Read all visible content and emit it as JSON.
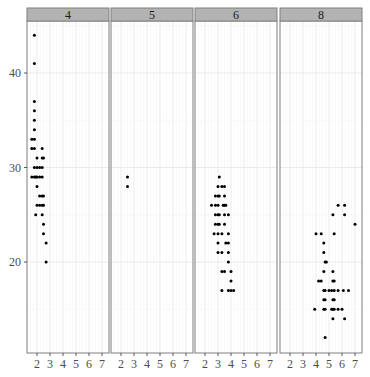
{
  "chart_data": {
    "type": "scatter",
    "title": "",
    "xlabel": "",
    "ylabel": "",
    "facet_by": "cyl",
    "facets": [
      "4",
      "5",
      "6",
      "8"
    ],
    "xlim": [
      1.2,
      7.2
    ],
    "ylim": [
      10.5,
      45.5
    ],
    "x_ticks": [
      2,
      3,
      4,
      5,
      6,
      7
    ],
    "y_ticks": [
      20,
      30,
      40
    ],
    "grid": true,
    "legend": "none",
    "colors": {
      "point": "#000000",
      "strip_bg": "#b3b3b3",
      "strip_border": "#7f7f7f",
      "panel_border": "#7f7f7f",
      "grid_major": "#e6e6e6",
      "grid_minor": "#f2f2f2"
    },
    "panels": [
      {
        "label": "4",
        "points": [
          [
            1.8,
            44
          ],
          [
            1.8,
            41
          ],
          [
            1.8,
            37
          ],
          [
            1.8,
            36
          ],
          [
            1.8,
            35
          ],
          [
            1.8,
            34
          ],
          [
            1.8,
            33
          ],
          [
            1.6,
            33
          ],
          [
            1.6,
            32
          ],
          [
            1.8,
            32
          ],
          [
            2.4,
            32
          ],
          [
            2.0,
            31
          ],
          [
            2.4,
            31
          ],
          [
            2.5,
            31
          ],
          [
            1.8,
            30
          ],
          [
            2.0,
            30
          ],
          [
            2.2,
            30
          ],
          [
            2.4,
            30
          ],
          [
            1.6,
            29
          ],
          [
            1.8,
            29
          ],
          [
            1.9,
            29
          ],
          [
            2.0,
            29
          ],
          [
            2.2,
            29
          ],
          [
            2.4,
            29
          ],
          [
            2.0,
            28
          ],
          [
            2.2,
            27
          ],
          [
            2.4,
            27
          ],
          [
            2.5,
            27
          ],
          [
            2.0,
            26
          ],
          [
            2.2,
            26
          ],
          [
            2.4,
            26
          ],
          [
            2.5,
            26
          ],
          [
            1.9,
            25
          ],
          [
            2.4,
            25
          ],
          [
            2.5,
            24
          ],
          [
            2.5,
            23
          ],
          [
            2.7,
            22
          ],
          [
            2.7,
            20
          ]
        ]
      },
      {
        "label": "5",
        "points": [
          [
            2.5,
            29
          ],
          [
            2.5,
            28
          ]
        ]
      },
      {
        "label": "6",
        "points": [
          [
            3.1,
            29
          ],
          [
            3.0,
            28
          ],
          [
            3.3,
            28
          ],
          [
            3.5,
            28
          ],
          [
            2.8,
            27
          ],
          [
            3.0,
            27
          ],
          [
            3.1,
            27
          ],
          [
            3.5,
            27
          ],
          [
            2.5,
            26
          ],
          [
            2.8,
            26
          ],
          [
            3.0,
            26
          ],
          [
            3.4,
            26
          ],
          [
            3.5,
            26
          ],
          [
            3.6,
            26
          ],
          [
            2.8,
            25
          ],
          [
            3.0,
            25
          ],
          [
            3.1,
            25
          ],
          [
            3.5,
            25
          ],
          [
            3.8,
            25
          ],
          [
            2.8,
            24
          ],
          [
            3.0,
            24
          ],
          [
            3.1,
            24
          ],
          [
            3.5,
            24
          ],
          [
            2.7,
            23
          ],
          [
            3.0,
            23
          ],
          [
            3.3,
            23
          ],
          [
            3.8,
            23
          ],
          [
            3.0,
            22
          ],
          [
            3.6,
            22
          ],
          [
            3.8,
            22
          ],
          [
            3.0,
            21
          ],
          [
            3.3,
            21
          ],
          [
            3.8,
            21
          ],
          [
            3.8,
            20
          ],
          [
            4.0,
            19
          ],
          [
            3.3,
            19
          ],
          [
            3.5,
            19
          ],
          [
            4.0,
            18
          ],
          [
            3.3,
            17
          ],
          [
            3.8,
            17
          ],
          [
            4.0,
            17
          ],
          [
            4.2,
            17
          ]
        ]
      },
      {
        "label": "8",
        "points": [
          [
            5.7,
            26
          ],
          [
            6.2,
            26
          ],
          [
            5.3,
            25
          ],
          [
            6.2,
            25
          ],
          [
            7.0,
            24
          ],
          [
            4.0,
            23
          ],
          [
            4.4,
            23
          ],
          [
            5.4,
            23
          ],
          [
            4.6,
            22
          ],
          [
            4.6,
            21
          ],
          [
            4.7,
            20
          ],
          [
            4.8,
            20
          ],
          [
            4.6,
            19
          ],
          [
            5.3,
            19
          ],
          [
            4.2,
            18
          ],
          [
            4.4,
            18
          ],
          [
            5.3,
            18
          ],
          [
            5.4,
            18
          ],
          [
            4.6,
            17
          ],
          [
            4.7,
            17
          ],
          [
            5.0,
            17
          ],
          [
            5.2,
            17
          ],
          [
            5.4,
            17
          ],
          [
            5.7,
            17
          ],
          [
            6.1,
            17
          ],
          [
            6.5,
            17
          ],
          [
            4.6,
            16
          ],
          [
            4.7,
            16
          ],
          [
            5.3,
            16
          ],
          [
            5.4,
            16
          ],
          [
            3.9,
            15
          ],
          [
            4.6,
            15
          ],
          [
            4.7,
            15
          ],
          [
            5.2,
            15
          ],
          [
            5.3,
            15
          ],
          [
            5.4,
            15
          ],
          [
            5.7,
            15
          ],
          [
            6.0,
            15
          ],
          [
            5.3,
            14
          ],
          [
            6.2,
            14
          ],
          [
            4.7,
            12
          ]
        ]
      }
    ]
  }
}
